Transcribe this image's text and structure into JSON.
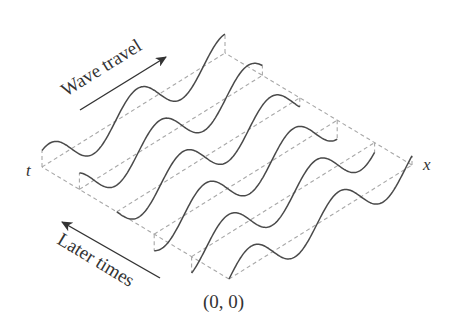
{
  "diagram": {
    "labels": {
      "wave_travel": "Wave travel",
      "later_times": "Later times",
      "x_axis": "x",
      "t_axis": "t",
      "origin": "(0, 0)"
    },
    "snapshots": {
      "count": 6,
      "periods_per_snapshot": 2.08,
      "phase_step_fraction_of_period": 0.1667,
      "waveform": "sine"
    },
    "colors": {
      "wave": "#4a4a4a",
      "guide": "#a8a8a8",
      "text": "#333333",
      "background": "#ffffff"
    }
  }
}
